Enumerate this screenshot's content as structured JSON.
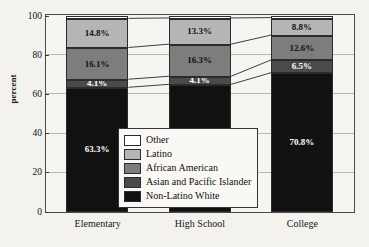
{
  "chart_data": {
    "type": "bar",
    "subtype": "stacked-percentage",
    "title": "",
    "xlabel": "",
    "ylabel": "percent",
    "ylim": [
      0,
      100
    ],
    "yticks": [
      0,
      20,
      40,
      60,
      80,
      100
    ],
    "grid": true,
    "legend_position": "inside-lower-center",
    "categories": [
      "Elementary",
      "High School",
      "College"
    ],
    "series": [
      {
        "name": "Non-Latino White",
        "color": "#111111",
        "text_color": "#ffffff",
        "values": [
          63.3,
          64.8,
          70.8
        ],
        "labels": [
          "63.3%",
          "64.8%",
          "70.8%"
        ]
      },
      {
        "name": "Asian and Pacific Islander",
        "color": "#4a4a4a",
        "text_color": "#ffffff",
        "values": [
          4.1,
          4.1,
          6.5
        ],
        "labels": [
          "4.1%",
          "4.1%",
          "6.5%"
        ]
      },
      {
        "name": "African American",
        "color": "#7d7d7d",
        "text_color": "#111111",
        "values": [
          16.1,
          16.3,
          12.6
        ],
        "labels": [
          "16.1%",
          "16.3%",
          "12.6%"
        ]
      },
      {
        "name": "Latino",
        "color": "#b5b5b5",
        "text_color": "#111111",
        "values": [
          14.8,
          13.3,
          8.8
        ],
        "labels": [
          "14.8%",
          "13.3%",
          "8.8%"
        ]
      },
      {
        "name": "Other",
        "color": "#ffffff",
        "text_color": "#111111",
        "values": [
          1.7,
          1.5,
          1.3
        ],
        "labels": [
          "",
          "",
          ""
        ]
      }
    ]
  },
  "axis": {
    "y_label": "percent",
    "y_ticks": [
      "100",
      "80",
      "60",
      "40",
      "20",
      "0"
    ],
    "x_ticks": [
      "Elementary",
      "High School",
      "College"
    ]
  },
  "legend": {
    "items": [
      {
        "label": "Other",
        "color": "#ffffff"
      },
      {
        "label": "Latino",
        "color": "#b5b5b5"
      },
      {
        "label": "African American",
        "color": "#7d7d7d"
      },
      {
        "label": "Asian and Pacific Islander",
        "color": "#4a4a4a"
      },
      {
        "label": "Non-Latino White",
        "color": "#111111"
      }
    ]
  }
}
